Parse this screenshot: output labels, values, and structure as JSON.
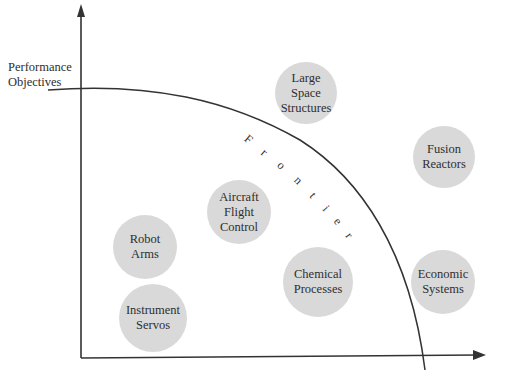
{
  "diagram": {
    "y_axis_label": "Performance\nObjectives",
    "curve_label": "Frontier",
    "curve_letters": [
      "F",
      "r",
      "o",
      "n",
      "t",
      "i",
      "e",
      "r"
    ],
    "bubbles": [
      {
        "id": "large-space-structures",
        "label": "Large\nSpace\nStructures"
      },
      {
        "id": "fusion-reactors",
        "label": "Fusion\nReactors"
      },
      {
        "id": "aircraft-flight-control",
        "label": "Aircraft\nFlight\nControl"
      },
      {
        "id": "robot-arms",
        "label": "Robot\nArms"
      },
      {
        "id": "chemical-processes",
        "label": "Chemical\nProcesses"
      },
      {
        "id": "economic-systems",
        "label": "Economic\nSystems"
      },
      {
        "id": "instrument-servos",
        "label": "Instrument\nServos"
      }
    ],
    "colors": {
      "bubble_fill": "#d9d9d9",
      "line": "#333333",
      "background": "#ffffff"
    }
  }
}
